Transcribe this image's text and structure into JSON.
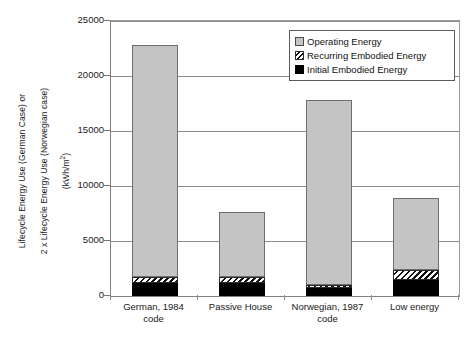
{
  "chart_data": {
    "type": "bar",
    "subtype": "stacked-vertical",
    "title": "",
    "xlabel": "",
    "ylabel": "Lifecycle Energy Use (German Case) or\n2 x Lifecycle Energy Use (Norwegian case)\n(kWh/m2)",
    "ylabel_lines": [
      "Lifecycle Energy Use (German Case) or",
      "2 x Lifecycle Energy Use (Norwegian case)",
      "(kWh/m2)"
    ],
    "ylim": [
      0,
      25000
    ],
    "yticks": [
      0,
      5000,
      10000,
      15000,
      20000,
      25000
    ],
    "ytick_labels": [
      "0",
      "5000",
      "10000",
      "15000",
      "20000",
      "25000"
    ],
    "grid": true,
    "grid_axis": "y",
    "legend_position": "upper right",
    "categories": [
      "German, 1984\ncode",
      "Passive House",
      "Norwegian, 1987\ncode",
      "Low energy"
    ],
    "category_labels": [
      {
        "line1": "German, 1984",
        "line2": "code"
      },
      {
        "line1": "Passive House",
        "line2": ""
      },
      {
        "line1": "Norwegian, 1987",
        "line2": "code"
      },
      {
        "line1": "Low energy",
        "line2": ""
      }
    ],
    "series": [
      {
        "name": "Initial Embodied Energy",
        "color": "#000000",
        "fill": "solid",
        "values": [
          1200,
          1150,
          750,
          1450
        ]
      },
      {
        "name": "Recurring Embodied Energy",
        "color": "#ffffff",
        "fill": "hatch-diagonal",
        "values": [
          550,
          600,
          250,
          900
        ]
      },
      {
        "name": "Operating Energy",
        "color": "#c4c4c4",
        "fill": "solid",
        "values": [
          21050,
          5850,
          16850,
          6550
        ]
      }
    ],
    "totals": [
      22800,
      7600,
      17850,
      8900
    ]
  },
  "legend": {
    "items": [
      {
        "label": "Operating Energy",
        "swatch": "operating-swatch"
      },
      {
        "label": "Recurring Embodied Energy",
        "swatch": "recurring-swatch"
      },
      {
        "label": "Initial Embodied Energy",
        "swatch": "initial-swatch"
      }
    ]
  },
  "axis": {
    "y_title_line1": "Lifecycle Energy Use (German Case) or",
    "y_title_line2": "2 x Lifecycle Energy Use (Norwegian case)",
    "y_title_line3_prefix": "(kWh/m",
    "y_title_line3_sup": "2",
    "y_title_line3_suffix": ")"
  }
}
